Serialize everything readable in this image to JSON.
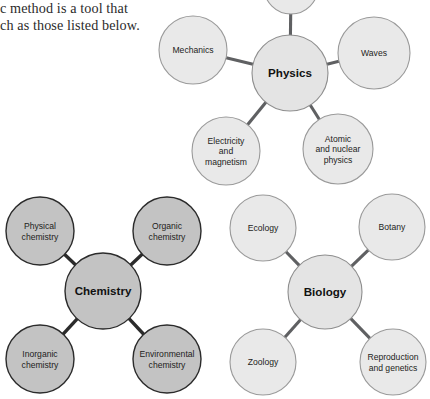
{
  "page": {
    "background_color": "#ffffff",
    "width": 430,
    "height": 399
  },
  "body_text": {
    "line1": "c method is a tool that",
    "line2": "ch as those listed below."
  },
  "colors": {
    "light_fill": "#e9e9e9",
    "light_stroke": "#9a9a9a",
    "dark_fill": "#c3c3c3",
    "dark_stroke": "#2b2b2b",
    "edge_light": "#5f6062",
    "edge_dark": "#2b2b2b",
    "text": "#1d1d1b"
  },
  "diagrams": [
    {
      "id": "physics",
      "hub": {
        "label": "Physics",
        "cx": 290,
        "cy": 73,
        "r": 38,
        "style": "light"
      },
      "satellites": [
        {
          "id": "clipped-top",
          "lines": [],
          "cx": 291,
          "cy": -13,
          "r": 27,
          "style": "light"
        },
        {
          "id": "mechanics",
          "lines": [
            "Mechanics"
          ],
          "cx": 193,
          "cy": 50,
          "r": 34,
          "style": "light"
        },
        {
          "id": "waves",
          "lines": [
            "Waves"
          ],
          "cx": 374,
          "cy": 53,
          "r": 36,
          "style": "light"
        },
        {
          "id": "electricity-and-magnetism",
          "lines": [
            "Electricity",
            "and",
            "magnetism"
          ],
          "cx": 226,
          "cy": 151,
          "r": 34,
          "style": "light"
        },
        {
          "id": "atomic-and-nuclear-physics",
          "lines": [
            "Atomic",
            "and nuclear",
            "physics"
          ],
          "cx": 338,
          "cy": 149,
          "r": 35,
          "style": "light"
        }
      ]
    },
    {
      "id": "chemistry",
      "hub": {
        "label": "Chemistry",
        "cx": 103,
        "cy": 291,
        "r": 38,
        "style": "dark"
      },
      "satellites": [
        {
          "id": "physical-chemistry",
          "lines": [
            "Physical",
            "chemistry"
          ],
          "cx": 40,
          "cy": 231,
          "r": 34,
          "style": "dark"
        },
        {
          "id": "organic-chemistry",
          "lines": [
            "Organic",
            "chemistry"
          ],
          "cx": 167,
          "cy": 231,
          "r": 34,
          "style": "dark"
        },
        {
          "id": "inorganic-chemistry",
          "lines": [
            "Inorganic",
            "chemistry"
          ],
          "cx": 40,
          "cy": 359,
          "r": 34,
          "style": "dark"
        },
        {
          "id": "environmental-chemistry",
          "lines": [
            "Environmental",
            "chemistry"
          ],
          "cx": 167,
          "cy": 359,
          "r": 34,
          "style": "dark"
        }
      ]
    },
    {
      "id": "biology",
      "hub": {
        "label": "Biology",
        "cx": 325,
        "cy": 292,
        "r": 37,
        "style": "light"
      },
      "satellites": [
        {
          "id": "ecology",
          "lines": [
            "Ecology"
          ],
          "cx": 263,
          "cy": 228,
          "r": 33,
          "style": "light"
        },
        {
          "id": "botany",
          "lines": [
            "Botany"
          ],
          "cx": 392,
          "cy": 227,
          "r": 33,
          "style": "light"
        },
        {
          "id": "zoology",
          "lines": [
            "Zoology"
          ],
          "cx": 263,
          "cy": 362,
          "r": 33,
          "style": "light"
        },
        {
          "id": "reproduction-and-genetics",
          "lines": [
            "Reproduction",
            "and genetics"
          ],
          "cx": 393,
          "cy": 362,
          "r": 33,
          "style": "light"
        }
      ]
    }
  ]
}
